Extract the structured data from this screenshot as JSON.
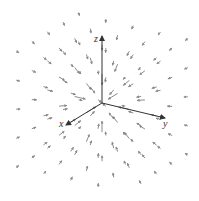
{
  "diagram": {
    "type": "3d-vector-field",
    "origin": [
      102,
      103
    ],
    "colors": {
      "axis": "#333333",
      "vector": "#8a8a8a",
      "background": "#ffffff"
    },
    "axes": [
      {
        "name": "x",
        "label": "x",
        "end": [
          66,
          125
        ],
        "label_pos": [
          59,
          127
        ]
      },
      {
        "name": "y",
        "label": "y",
        "end": [
          165,
          118
        ],
        "label_pos": [
          163,
          127
        ]
      },
      {
        "name": "z",
        "label": "z",
        "end": [
          102,
          36
        ],
        "label_pos": [
          94,
          42
        ]
      }
    ]
  }
}
